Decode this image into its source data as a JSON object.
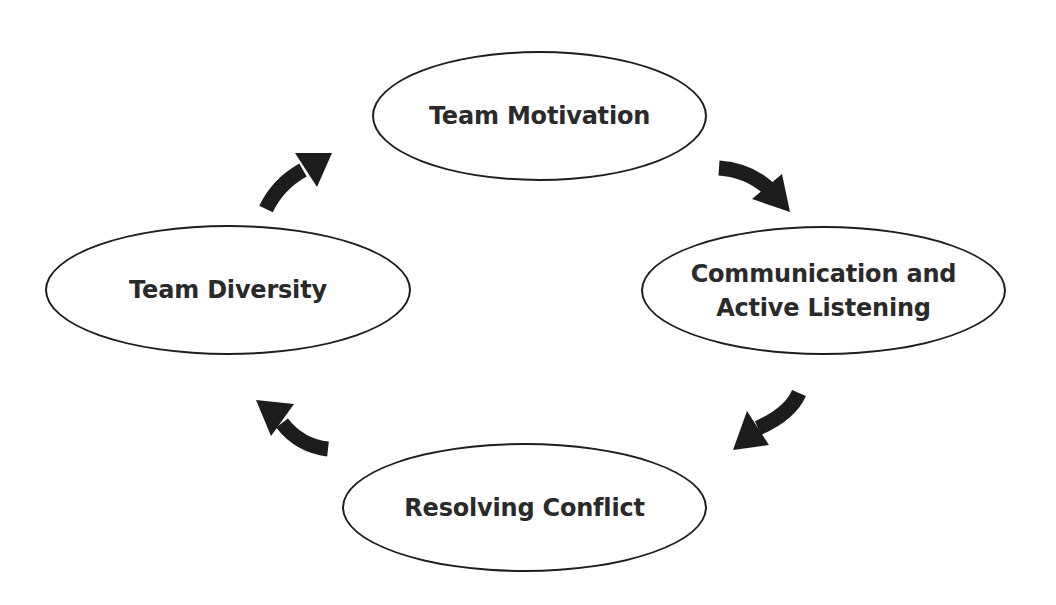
{
  "diagram": {
    "type": "cycle",
    "nodes": [
      {
        "id": "top",
        "label": "Team Motivation"
      },
      {
        "id": "right",
        "label": "Communication and\nActive Listening"
      },
      {
        "id": "bottom",
        "label": "Resolving Conflict"
      },
      {
        "id": "left",
        "label": "Team Diversity"
      }
    ],
    "edges": [
      {
        "from": "Team Motivation",
        "to": "Communication and Active Listening",
        "direction": "clockwise"
      },
      {
        "from": "Communication and Active Listening",
        "to": "Resolving Conflict",
        "direction": "clockwise"
      },
      {
        "from": "Resolving Conflict",
        "to": "Team Diversity",
        "direction": "clockwise"
      },
      {
        "from": "Team Diversity",
        "to": "Team Motivation",
        "direction": "clockwise"
      }
    ],
    "colors": {
      "stroke": "#1e1e1e",
      "arrow_fill": "#1c1c1c",
      "text": "#2a2a2a",
      "background": "#ffffff"
    }
  }
}
